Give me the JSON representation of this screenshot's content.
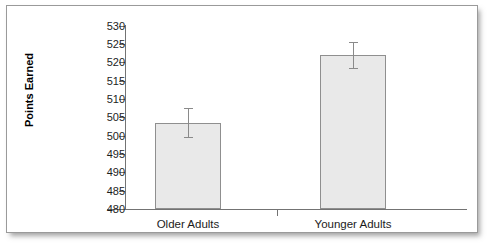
{
  "figure": {
    "background_color": "#ffffff",
    "border_color": "#9a9a9a"
  },
  "chart_data": {
    "type": "bar",
    "title": "",
    "xlabel": "",
    "ylabel": "Points Earned",
    "categories": [
      "Older Adults",
      "Younger Adults"
    ],
    "values": [
      503.5,
      522.0
    ],
    "errors": [
      4.0,
      3.5
    ],
    "error_low": [
      499.5,
      518.5
    ],
    "error_high": [
      507.5,
      525.5
    ],
    "ylim": [
      480,
      530
    ],
    "ytick_step": 5,
    "ytick_labels": [
      "530",
      "525",
      "520",
      "515",
      "510",
      "505",
      "500",
      "495",
      "490",
      "485",
      "480"
    ],
    "ytick_values": [
      530,
      525,
      520,
      515,
      510,
      505,
      500,
      495,
      490,
      485,
      480
    ],
    "grid": false,
    "legend": false,
    "bar_fill_color": "#e9e9e9",
    "bar_edge_color": "#8f8f8f",
    "errorbar_color": "#8a8a8a",
    "axis_color": "#737373"
  }
}
